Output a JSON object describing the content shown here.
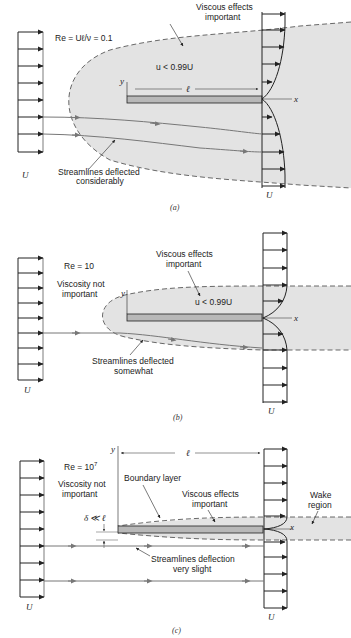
{
  "colors": {
    "shade": "#e3e3e3",
    "plate": "#b8b8b8",
    "line": "#222222",
    "streamline": "#777777"
  },
  "panel_a": {
    "re_label": "Re = Uℓ/ν = 0.1",
    "viscous_line1": "Viscous effects",
    "viscous_line2": "important",
    "u_label": "u < 0.99U",
    "ell": "ℓ",
    "y_axis": "y",
    "x_axis": "x",
    "streamline_line1": "Streamlines deflected",
    "streamline_line2": "considerably",
    "U_left": "U",
    "U_right": "U",
    "caption": "(a)"
  },
  "panel_b": {
    "re_label": "Re =  10",
    "visc_not_line1": "Viscosity not",
    "visc_not_line2": "important",
    "viscous_line1": "Viscous effects",
    "viscous_line2": "important",
    "u_label": "u < 0.99U",
    "y_axis": "y",
    "x_axis": "x",
    "streamline_line1": "Streamlines deflected",
    "streamline_line2": "somewhat",
    "U_left": "U",
    "U_right": "U",
    "caption": "(b)"
  },
  "panel_c": {
    "re_label": "Re =  10",
    "re_exp": "7",
    "visc_not_line1": "Viscosity not",
    "visc_not_line2": "important",
    "boundary_layer": "Boundary layer",
    "viscous_line1": "Viscous effects",
    "viscous_line2": "important",
    "wake_line1": "Wake",
    "wake_line2": "region",
    "delta": "δ ≪ ℓ",
    "ell": "ℓ",
    "y_axis": "y",
    "x_axis": "x",
    "streamline_line1": "Streamlines deflection",
    "streamline_line2": "very slight",
    "U_left": "U",
    "U_right": "U",
    "caption": "(c)"
  }
}
